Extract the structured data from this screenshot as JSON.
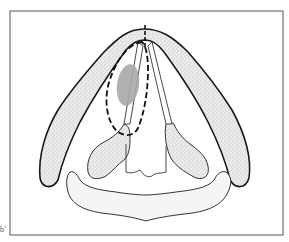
{
  "figure": {
    "label": "b",
    "label_superscript": "1",
    "colors": {
      "frame": "#555555",
      "outline": "#1a1a1a",
      "stipple_fill": "#e4e4e4",
      "lesion": "#a8a8a8",
      "cricoid_fill": "#f4f4f4"
    },
    "parts": [
      {
        "name": "thyroid-cartilage",
        "style": "stippled"
      },
      {
        "name": "left-arytenoid",
        "style": "stippled"
      },
      {
        "name": "right-arytenoid",
        "style": "stippled"
      },
      {
        "name": "cricoid-cartilage",
        "style": "light"
      },
      {
        "name": "left-vocal-fold",
        "style": "outline"
      },
      {
        "name": "right-vocal-fold",
        "style": "outline"
      },
      {
        "name": "lesion",
        "style": "gray-fill"
      },
      {
        "name": "resection-margin",
        "style": "dashed"
      },
      {
        "name": "midline-marker",
        "style": "dashed"
      }
    ]
  }
}
